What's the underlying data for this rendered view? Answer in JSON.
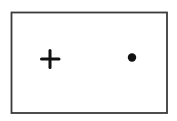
{
  "diagram": {
    "elements": [
      {
        "kind": "frame",
        "shape": "rectangle"
      },
      {
        "kind": "symbol",
        "shape": "plus",
        "glyph": "+"
      },
      {
        "kind": "symbol",
        "shape": "dot",
        "glyph": "•"
      }
    ],
    "colors": {
      "stroke": "#3a3a3a",
      "symbol": "#111111",
      "background": "#ffffff"
    }
  }
}
